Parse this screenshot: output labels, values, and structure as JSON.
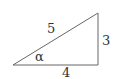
{
  "diagram": {
    "type": "right-triangle",
    "vertices": {
      "acute_angle_vertex": [
        13,
        65
      ],
      "right_angle_vertex": [
        98,
        65
      ],
      "top_vertex": [
        98,
        13
      ]
    },
    "sides": {
      "hypotenuse": "5",
      "vertical_leg": "3",
      "base": "4"
    },
    "angle_label": "α",
    "colors": {
      "line": "#666666",
      "text": "#333333",
      "background": "#ffffff"
    }
  }
}
